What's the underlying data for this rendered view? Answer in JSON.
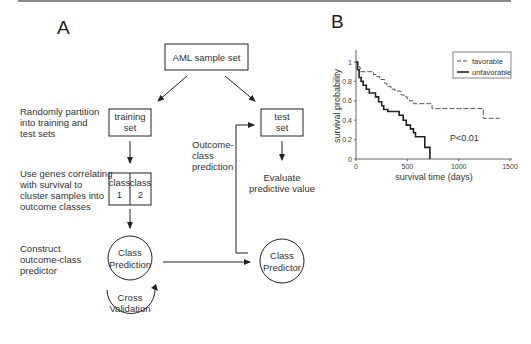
{
  "figure": {
    "panel_a": {
      "label": "A",
      "nodes": {
        "aml": "AML sample set",
        "training_l1": "training",
        "training_l2": "set",
        "test_l1": "test",
        "test_l2": "set",
        "class1_l1": "class",
        "class1_l2": "1",
        "class2_l1": "class",
        "class2_l2": "2",
        "class_prediction_l1": "Class",
        "class_prediction_l2": "Prediction",
        "cross_validation_l1": "Cross",
        "cross_validation_l2": "Validation",
        "class_predictor_l1": "Class",
        "class_predictor_l2": "Predictor"
      },
      "notes": {
        "partition": [
          "Randomly partition",
          "into training and",
          "test sets"
        ],
        "cluster": [
          "Use genes correlating",
          "with survival to",
          "cluster samples into",
          "outcome classes"
        ],
        "construct": [
          "Construct",
          "outcome-class",
          "predictor"
        ],
        "outcome": [
          "Outcome-",
          "class",
          "prediction"
        ],
        "evaluate": [
          "Evaluate",
          "predictive value"
        ]
      }
    },
    "panel_b": {
      "label": "B",
      "annotation": "P<0.01"
    }
  },
  "chart_data": {
    "type": "line",
    "subtype": "kaplan-meier step",
    "title": "",
    "xlabel": "survival time (days)",
    "ylabel": "survival probability",
    "xlim": [
      0,
      1500
    ],
    "ylim": [
      0,
      1
    ],
    "xticks": [
      "0",
      "500",
      "1000",
      "1500"
    ],
    "yticks": [
      "0",
      "0.2",
      "0.4",
      "0.6",
      "0.8",
      "1"
    ],
    "grid": false,
    "legend_position": "upper right",
    "annotation": "P<0.01",
    "series": [
      {
        "name": "favorable",
        "style": "dashed",
        "points": [
          [
            0,
            1.0
          ],
          [
            20,
            0.95
          ],
          [
            40,
            0.9
          ],
          [
            120,
            0.9
          ],
          [
            170,
            0.87
          ],
          [
            200,
            0.85
          ],
          [
            230,
            0.82
          ],
          [
            280,
            0.78
          ],
          [
            300,
            0.75
          ],
          [
            340,
            0.72
          ],
          [
            380,
            0.7
          ],
          [
            440,
            0.66
          ],
          [
            470,
            0.64
          ],
          [
            500,
            0.62
          ],
          [
            520,
            0.6
          ],
          [
            560,
            0.57
          ],
          [
            720,
            0.57
          ],
          [
            740,
            0.52
          ],
          [
            1230,
            0.52
          ],
          [
            1240,
            0.42
          ],
          [
            1400,
            0.42
          ]
        ]
      },
      {
        "name": "unfavorable",
        "style": "solid",
        "points": [
          [
            0,
            1.0
          ],
          [
            15,
            0.92
          ],
          [
            30,
            0.84
          ],
          [
            50,
            0.8
          ],
          [
            70,
            0.76
          ],
          [
            100,
            0.72
          ],
          [
            130,
            0.68
          ],
          [
            190,
            0.64
          ],
          [
            220,
            0.59
          ],
          [
            250,
            0.55
          ],
          [
            270,
            0.51
          ],
          [
            310,
            0.49
          ],
          [
            420,
            0.45
          ],
          [
            460,
            0.4
          ],
          [
            490,
            0.35
          ],
          [
            530,
            0.31
          ],
          [
            560,
            0.27
          ],
          [
            580,
            0.23
          ],
          [
            660,
            0.23
          ],
          [
            670,
            0.12
          ],
          [
            710,
            0.12
          ],
          [
            720,
            0.0
          ]
        ]
      }
    ]
  }
}
